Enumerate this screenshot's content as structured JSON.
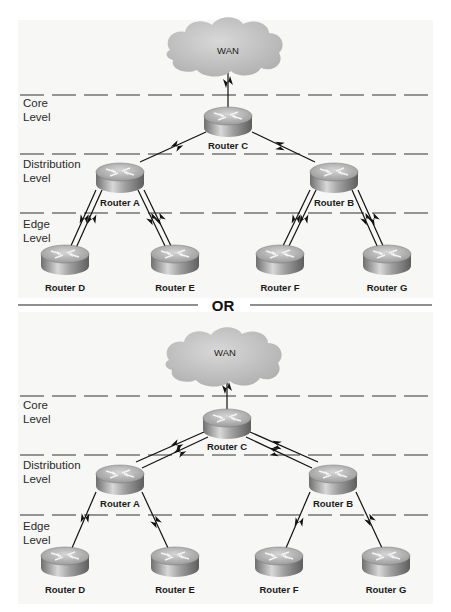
{
  "diagrams": [
    {
      "variant": "single-path",
      "cloud_label": "WAN",
      "levels": [
        {
          "line1": "Core",
          "line2": "Level"
        },
        {
          "line1": "Distribution",
          "line2": "Level"
        },
        {
          "line1": "Edge",
          "line2": "Level"
        }
      ],
      "routers": {
        "c": "Router C",
        "a": "Router A",
        "b": "Router B",
        "d": "Router D",
        "e": "Router E",
        "f": "Router F",
        "g": "Router G"
      }
    },
    {
      "variant": "redundant-core",
      "cloud_label": "WAN",
      "levels": [
        {
          "line1": "Core",
          "line2": "Level"
        },
        {
          "line1": "Distribution",
          "line2": "Level"
        },
        {
          "line1": "Edge",
          "line2": "Level"
        }
      ],
      "routers": {
        "c": "Router C",
        "a": "Router A",
        "b": "Router B",
        "d": "Router D",
        "e": "Router E",
        "f": "Router F",
        "g": "Router G"
      }
    }
  ],
  "separator_label": "OR",
  "colors": {
    "background": "#f7f7f5",
    "cloud": "#c4c4c4",
    "router_top": "#bdbdbd",
    "router_side": "#8a8a8a",
    "line": "#111111"
  }
}
